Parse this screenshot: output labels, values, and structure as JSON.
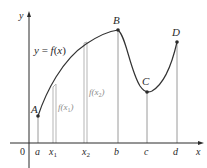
{
  "figure": {
    "curve_label": "y = f(x)",
    "axis_labels": {
      "x": "x",
      "y": "y",
      "origin": "0"
    },
    "tick_labels": [
      "a",
      "x1",
      "x2",
      "b",
      "c",
      "d"
    ],
    "points": [
      {
        "name": "A",
        "x": 38,
        "y": 116
      },
      {
        "name": "B",
        "x": 118,
        "y": 30
      },
      {
        "name": "C",
        "x": 147,
        "y": 92
      },
      {
        "name": "D",
        "x": 177,
        "y": 42
      }
    ],
    "heights": {
      "f_x1": "f(x1)",
      "f_x2": "f(x2)"
    },
    "colors": {
      "curve": "#333333",
      "axes": "#2a2a2a",
      "guides": "#9a9a9a",
      "bars": "#b5b5b5"
    }
  },
  "labels": {
    "A": "A",
    "B": "B",
    "C": "C",
    "D": "D",
    "a": "a",
    "x1": "x",
    "x1_sub": "1",
    "x2": "x",
    "x2_sub": "2",
    "b": "b",
    "c": "c",
    "d": "d",
    "x": "x",
    "y": "y",
    "zero": "0",
    "curve": "y = f(x)",
    "fx1_pre": "f(x",
    "fx1_sub": "1",
    "fx1_post": ")",
    "fx2_pre": "f(x",
    "fx2_sub": "2",
    "fx2_post": ")"
  }
}
